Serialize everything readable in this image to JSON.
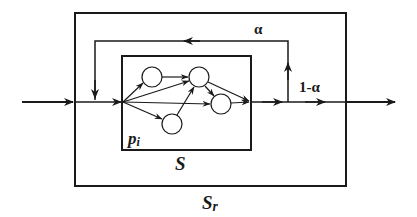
{
  "diagram": {
    "colors": {
      "stroke": "#1a1a1a",
      "node_fill": "#ffffff",
      "background": "#ffffff"
    },
    "boxes": {
      "outer": {
        "id": "Sr",
        "label_main": "S",
        "label_sub": "r",
        "x": 75,
        "y": 13,
        "w": 271,
        "h": 173
      },
      "inner": {
        "id": "S",
        "label": "S",
        "x": 122,
        "y": 56,
        "w": 129,
        "h": 94
      }
    },
    "labels": {
      "alpha": "α",
      "one_minus_alpha": "1-α",
      "p_main": "p",
      "p_sub": "i",
      "inner_system": "S",
      "outer_system_main": "S",
      "outer_system_sub": "r"
    },
    "nodes": [
      {
        "id": "n1",
        "cx": 152,
        "cy": 77,
        "r": 10
      },
      {
        "id": "n2",
        "cx": 199,
        "cy": 77,
        "r": 10
      },
      {
        "id": "n3",
        "cx": 172,
        "cy": 124,
        "r": 10
      },
      {
        "id": "n4",
        "cx": 221,
        "cy": 104,
        "r": 10
      }
    ],
    "edges": [
      {
        "from": "source",
        "to": "n1"
      },
      {
        "from": "source",
        "to": "n2"
      },
      {
        "from": "source",
        "to": "n4"
      },
      {
        "from": "source",
        "to": "n3"
      },
      {
        "from": "n1",
        "to": "n2"
      },
      {
        "from": "n3",
        "to": "n2"
      },
      {
        "from": "n2",
        "to": "n4"
      },
      {
        "from": "n2",
        "to": "sink"
      },
      {
        "from": "n4",
        "to": "sink"
      }
    ],
    "flow": {
      "input": "external input enters Sr",
      "feedback_fraction": "α",
      "output_fraction": "1-α"
    }
  }
}
